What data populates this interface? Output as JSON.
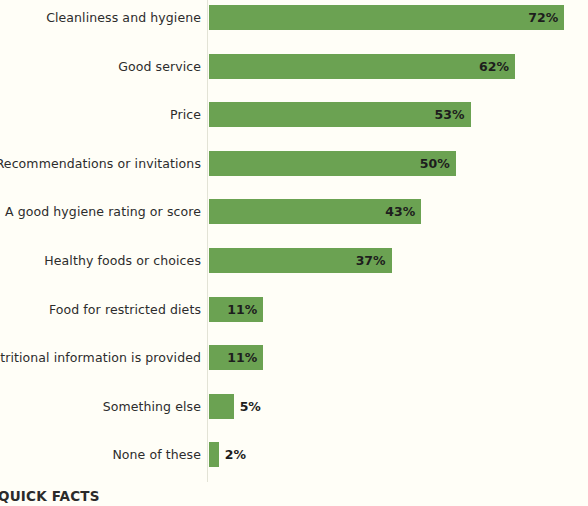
{
  "chart_data": {
    "type": "bar",
    "orientation": "horizontal",
    "title": "",
    "xlabel": "",
    "ylabel": "",
    "xlim": [
      0,
      76
    ],
    "grid": false,
    "legend": null,
    "value_suffix": "%",
    "categories": [
      "Cleanliness and hygiene",
      "Good service",
      "Price",
      "Recommendations or invitations",
      "A good hygiene rating or score",
      "Healthy foods or choices",
      "Food for restricted diets",
      "Nutritional information is provided",
      "Something else",
      "None of these"
    ],
    "values": [
      72,
      62,
      53,
      50,
      43,
      37,
      11,
      11,
      5,
      2
    ],
    "value_labels": [
      "72%",
      "62%",
      "53%",
      "50%",
      "43%",
      "37%",
      "11%",
      "11%",
      "5%",
      "2%"
    ],
    "bar_color": "#6ba252",
    "background_color": "#fffef7",
    "label_color": "#2c2c2c"
  },
  "footer": {
    "title": "QUICK FACTS"
  }
}
